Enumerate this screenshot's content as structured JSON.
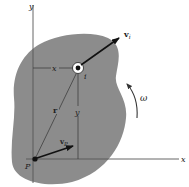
{
  "diagram": {
    "type": "rigid-body-velocity",
    "colors": {
      "body_fill": "#8c8c8c",
      "axis": "#555555",
      "line": "#333333",
      "arrow": "#111111",
      "background": "#ffffff"
    },
    "labels": {
      "y_axis": "y",
      "x_axis": "x",
      "point_p": "P",
      "point_i": "i",
      "velocity_i": "v",
      "velocity_i_sub": "i",
      "velocity_p": "v",
      "velocity_p_sub": "P",
      "position_vector": "r",
      "x_distance": "x",
      "y_distance": "y",
      "angular_velocity": "ω"
    }
  }
}
